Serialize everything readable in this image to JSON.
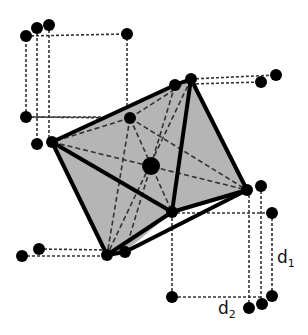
{
  "diagram": {
    "labels": {
      "d1": {
        "main": "d",
        "sub": "1"
      },
      "d2": {
        "main": "d",
        "sub": "2"
      }
    },
    "colors": {
      "face": "#b5b5b5",
      "edge": "#000000",
      "dashed": "#333333",
      "atom": "#000000"
    },
    "vertices": {
      "left": [
        52,
        142
      ],
      "top": [
        191,
        79
      ],
      "top_back": [
        175,
        85
      ],
      "right": [
        247,
        190
      ],
      "bottom": [
        107,
        255
      ],
      "bottom_back": [
        125,
        252
      ],
      "front": [
        172,
        212
      ],
      "back": [
        130,
        118
      ],
      "center": [
        151,
        166
      ]
    },
    "projected_points": [
      [
        26,
        36
      ],
      [
        37,
        28
      ],
      [
        49,
        25
      ],
      [
        127,
        34
      ],
      [
        26,
        117
      ],
      [
        37,
        144
      ],
      [
        261,
        80
      ],
      [
        276,
        74
      ],
      [
        261,
        186
      ],
      [
        272,
        213
      ],
      [
        22,
        255
      ],
      [
        39,
        249
      ],
      [
        172,
        297
      ],
      [
        249,
        308
      ],
      [
        262,
        304
      ],
      [
        272,
        296
      ]
    ]
  }
}
